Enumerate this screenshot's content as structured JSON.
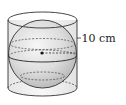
{
  "figure": {
    "type": "sphere inscribed in cylinder",
    "radius_label": "10 cm"
  },
  "colors": {
    "stroke": "#333333",
    "sphere_fill_light": "#f2f2f2",
    "sphere_fill_dark": "#bdbdbd",
    "cylinder_fill": "#ececec",
    "background": "#ffffff"
  }
}
